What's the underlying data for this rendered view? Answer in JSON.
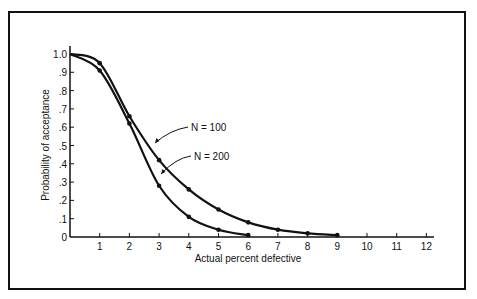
{
  "chart_data": {
    "type": "line",
    "title": "",
    "xlabel": "Actual percent defective",
    "ylabel": "Probability of acceptance",
    "xlim": [
      0,
      12
    ],
    "ylim": [
      0,
      1.0
    ],
    "x_ticks": [
      "1",
      "2",
      "3",
      "4",
      "5",
      "6",
      "7",
      "8",
      "9",
      "10",
      "11",
      "12"
    ],
    "y_ticks": [
      "0",
      ".1",
      ".2",
      ".3",
      ".4",
      ".5",
      ".6",
      ".7",
      ".8",
      ".9",
      "1.0"
    ],
    "grid": false,
    "legend": "inline annotations",
    "series": [
      {
        "name": "N = 100",
        "x": [
          0,
          1,
          2,
          3,
          4,
          5,
          6,
          7,
          8,
          9
        ],
        "y": [
          1.0,
          0.95,
          0.66,
          0.42,
          0.26,
          0.15,
          0.08,
          0.04,
          0.02,
          0.01
        ]
      },
      {
        "name": "N = 200",
        "x": [
          0,
          1,
          2,
          3,
          4,
          5,
          6
        ],
        "y": [
          1.0,
          0.91,
          0.62,
          0.28,
          0.11,
          0.04,
          0.01
        ]
      }
    ],
    "annotations": [
      {
        "text": "N = 100",
        "x": 3.0,
        "y": 0.5
      },
      {
        "text": "N = 200",
        "x": 2.4,
        "y": 0.37
      }
    ]
  }
}
